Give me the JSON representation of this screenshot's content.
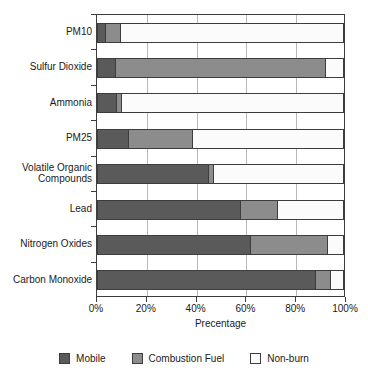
{
  "chart_data": {
    "type": "bar",
    "orientation": "horizontal",
    "stacked": true,
    "normalized": "percent",
    "title": "",
    "xlabel": "Precentage",
    "ylabel": "",
    "xlim": [
      0,
      100
    ],
    "xticks": [
      0,
      20,
      40,
      60,
      80,
      100
    ],
    "xtick_labels": [
      "0%",
      "20%",
      "40%",
      "60%",
      "80%",
      "100%"
    ],
    "grid": true,
    "grid_axis": "x",
    "legend_position": "bottom",
    "categories": [
      "PM10",
      "Sulfur Dioxide",
      "Ammonia",
      "PM25",
      "Volatile Organic\nCompounds",
      "Lead",
      "Nitrogen Oxides",
      "Carbon Monoxide"
    ],
    "series": [
      {
        "name": "Mobile",
        "color": "#5a5a5a",
        "values": [
          3.5,
          7.5,
          8.0,
          13.0,
          45.0,
          58.0,
          62.0,
          88.0
        ]
      },
      {
        "name": "Combustion Fuel",
        "color": "#8c8c8c",
        "values": [
          6.5,
          85.0,
          2.5,
          26.0,
          2.5,
          15.0,
          31.0,
          6.5
        ]
      },
      {
        "name": "Non-burn",
        "color": "#fbfbfb",
        "values": [
          90.0,
          7.5,
          89.5,
          61.0,
          52.5,
          27.0,
          7.0,
          5.5
        ]
      }
    ]
  },
  "legend": {
    "items": [
      {
        "label": "Mobile",
        "color": "#5a5a5a"
      },
      {
        "label": "Combustion Fuel",
        "color": "#8c8c8c"
      },
      {
        "label": "Non-burn",
        "color": "#fbfbfb"
      }
    ]
  },
  "axis": {
    "x_title": "Precentage"
  }
}
